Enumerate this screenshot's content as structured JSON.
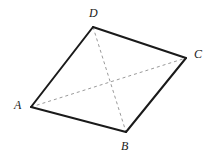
{
  "figure": {
    "kind": "geometry-diagram",
    "canvas": {
      "width": 218,
      "height": 160,
      "background": "#ffffff"
    },
    "style": {
      "side_color": "#1a1a1a",
      "side_width": 2,
      "diagonal_color": "#9a9a9a",
      "diagonal_width": 1,
      "diagonal_dash": "3,3",
      "label_color": "#1a1a1a",
      "label_font_size": "12px"
    },
    "vertices": [
      {
        "id": "A",
        "label": "A",
        "x": 31,
        "y": 107,
        "label_x": 14,
        "label_y": 99
      },
      {
        "id": "B",
        "label": "B",
        "x": 126,
        "y": 132,
        "label_x": 121,
        "label_y": 140
      },
      {
        "id": "C",
        "label": "C",
        "x": 186,
        "y": 58,
        "label_x": 194,
        "label_y": 48
      },
      {
        "id": "D",
        "label": "D",
        "x": 93,
        "y": 27,
        "label_x": 89,
        "label_y": 7
      }
    ],
    "sides": [
      {
        "id": "AD",
        "from": "A",
        "to": "D",
        "x1": 31,
        "y1": 107,
        "x2": 93,
        "y2": 27,
        "style": "solid"
      },
      {
        "id": "DC",
        "from": "D",
        "to": "C",
        "x1": 93,
        "y1": 27,
        "x2": 186,
        "y2": 58,
        "style": "solid"
      },
      {
        "id": "CB",
        "from": "C",
        "to": "B",
        "x1": 186,
        "y1": 58,
        "x2": 126,
        "y2": 132,
        "style": "solid"
      },
      {
        "id": "BA",
        "from": "B",
        "to": "A",
        "x1": 126,
        "y1": 132,
        "x2": 31,
        "y2": 107,
        "style": "solid"
      }
    ],
    "diagonals": [
      {
        "id": "AC",
        "from": "A",
        "to": "C",
        "x1": 31,
        "y1": 107,
        "x2": 186,
        "y2": 58,
        "style": "dashed"
      },
      {
        "id": "DB",
        "from": "D",
        "to": "B",
        "x1": 93,
        "y1": 27,
        "x2": 126,
        "y2": 132,
        "style": "dashed"
      }
    ],
    "intersection": {
      "id": "diagonal-intersection",
      "x": 108,
      "y": 82
    }
  }
}
